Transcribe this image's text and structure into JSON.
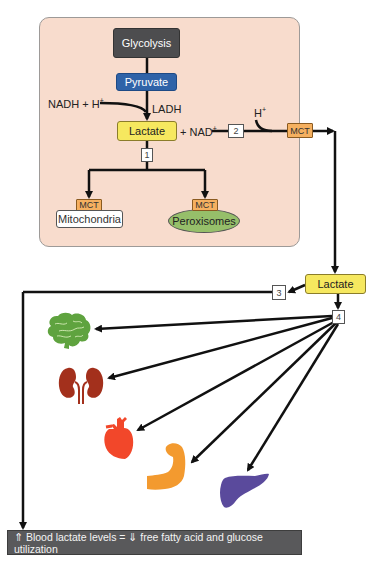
{
  "diagram": {
    "cell_panel": {
      "glycolysis": "Glycolysis",
      "pyruvate": "Pyruvate",
      "cofactor_in": "NADH + H",
      "cofactor_in_sup": "+",
      "enzyme": "LADH",
      "lactate": "Lactate",
      "cofactor_out": "+ NAD",
      "cofactor_out_sup": "+",
      "proton": "H",
      "proton_sup": "+",
      "step_1": "1",
      "step_2": "2",
      "transporter_export": "MCT",
      "mitochondria": {
        "transporter": "MCT",
        "label": "Mitochondria"
      },
      "peroxisomes": {
        "transporter": "MCT",
        "label": "Peroxisomes"
      }
    },
    "circulation": {
      "lactate": "Lactate",
      "step_3": "3",
      "step_4": "4"
    },
    "organs": [
      {
        "name": "Brain",
        "icon": "brain-icon",
        "color": "#5fa33f"
      },
      {
        "name": "Kidneys",
        "icon": "kidney-icon",
        "color": "#a3301c"
      },
      {
        "name": "Heart",
        "icon": "heart-icon",
        "color": "#f2472a"
      },
      {
        "name": "Muscle",
        "icon": "muscle-arm-icon",
        "color": "#f39a2f"
      },
      {
        "name": "Liver",
        "icon": "liver-icon",
        "color": "#5a4a9c"
      }
    ],
    "conclusion": "⇑ Blood lactate levels = ⇓ free fatty acid and glucose utilization"
  },
  "colors": {
    "panel_bg": "#f8dccd",
    "glycolysis": "#4d4d4f",
    "pyruvate": "#2f63a8",
    "lactate": "#f6e85f",
    "mct": "#f5b060",
    "peroxisomes": "#96bf6a",
    "conclusion_bg": "#59595b"
  }
}
